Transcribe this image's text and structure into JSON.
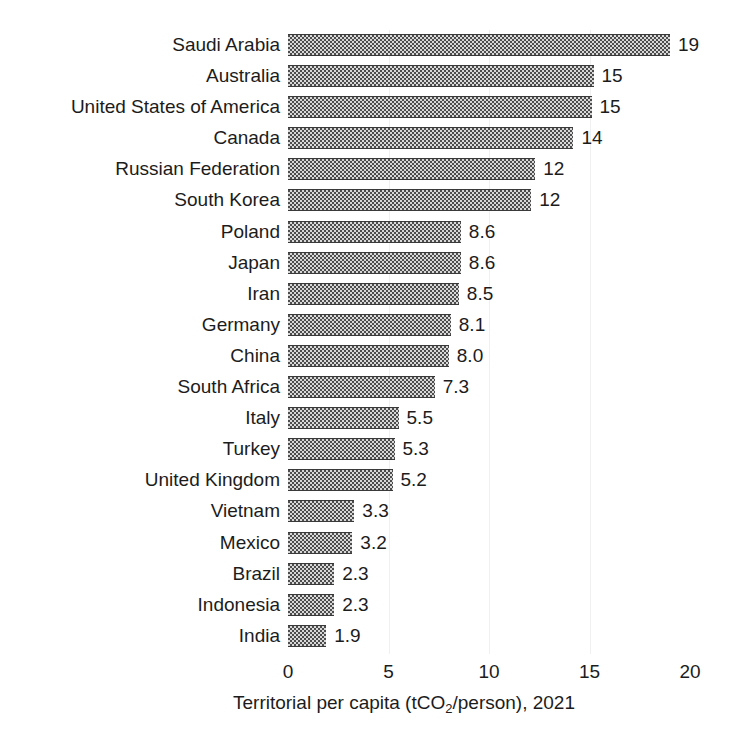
{
  "chart_data": {
    "type": "bar",
    "orientation": "horizontal",
    "title": "",
    "xlabel_parts": {
      "before": "Territorial per capita (tCO",
      "sub": "2",
      "after": "/person), 2021"
    },
    "xlabel": "Territorial per capita (tCO2/person), 2021",
    "ylabel": "",
    "xlim": [
      0,
      20
    ],
    "xticks": [
      "0",
      "5",
      "10",
      "15",
      "20"
    ],
    "xtick_values": [
      0,
      5,
      10,
      15,
      20
    ],
    "grid": "vertical-faint",
    "legend": "none",
    "bar_color": "#4d4d4d",
    "bar_pattern": "checkerboard",
    "categories": [
      "Saudi Arabia",
      "Australia",
      "United States of America",
      "Canada",
      "Russian Federation",
      "South Korea",
      "Poland",
      "Japan",
      "Iran",
      "Germany",
      "China",
      "South Africa",
      "Italy",
      "Turkey",
      "United Kingdom",
      "Vietnam",
      "Mexico",
      "Brazil",
      "Indonesia",
      "India"
    ],
    "values": [
      19,
      15.2,
      15.1,
      14.2,
      12.3,
      12.1,
      8.6,
      8.6,
      8.5,
      8.1,
      8.0,
      7.3,
      5.5,
      5.3,
      5.2,
      3.3,
      3.2,
      2.3,
      2.3,
      1.9
    ],
    "data_labels": [
      "19",
      "15",
      "15",
      "14",
      "12",
      "12",
      "8.6",
      "8.6",
      "8.5",
      "8.1",
      "8.0",
      "7.3",
      "5.5",
      "5.3",
      "5.2",
      "3.3",
      "3.2",
      "2.3",
      "2.3",
      "1.9"
    ]
  }
}
